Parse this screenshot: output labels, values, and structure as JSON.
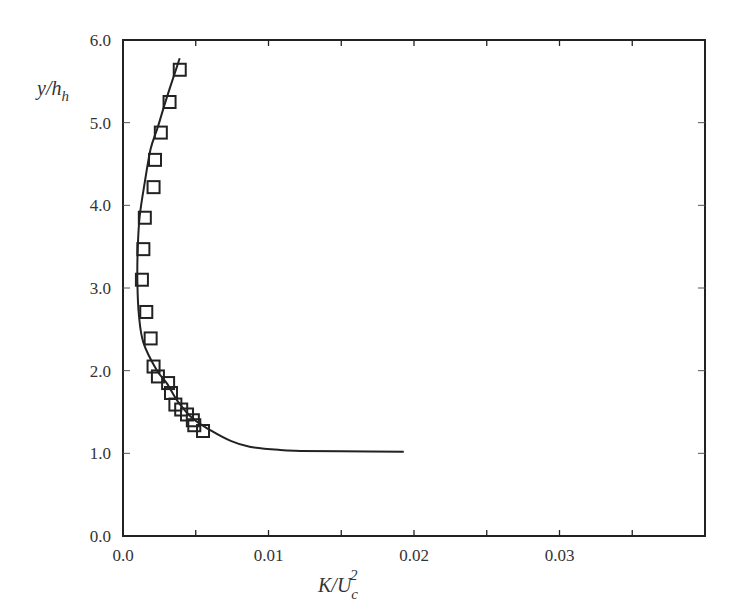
{
  "chart_data": {
    "type": "scatter",
    "title": "",
    "xlabel": "K/U_c^2",
    "xlabel_parts": {
      "main": "K/U",
      "sub": "c",
      "sup": "2"
    },
    "ylabel": "y/h_h",
    "ylabel_parts": {
      "main": "y/h",
      "sub": "h"
    },
    "xlim": [
      0.0,
      0.04
    ],
    "ylim": [
      0.0,
      6.0
    ],
    "x_ticks": [
      0.0,
      0.01,
      0.02,
      0.03
    ],
    "x_tick_labels": [
      "0.0",
      "0.01",
      "0.02",
      "0.03"
    ],
    "x_minor_ticks": [
      0.005,
      0.015,
      0.025,
      0.035
    ],
    "y_ticks": [
      0.0,
      1.0,
      2.0,
      3.0,
      4.0,
      5.0,
      6.0
    ],
    "y_tick_labels": [
      "0.0",
      "1.0",
      "2.0",
      "3.0",
      "4.0",
      "5.0",
      "6.0"
    ],
    "grid": false,
    "legend": null,
    "series": [
      {
        "name": "measurements",
        "kind": "markers",
        "marker": "open-square",
        "color": "#222222",
        "points": [
          [
            0.0039,
            5.64
          ],
          [
            0.0032,
            5.25
          ],
          [
            0.0026,
            4.88
          ],
          [
            0.0022,
            4.55
          ],
          [
            0.0021,
            4.22
          ],
          [
            0.0015,
            3.85
          ],
          [
            0.0014,
            3.47
          ],
          [
            0.0013,
            3.1
          ],
          [
            0.0016,
            2.71
          ],
          [
            0.0019,
            2.39
          ],
          [
            0.0021,
            2.05
          ],
          [
            0.0024,
            1.93
          ],
          [
            0.0031,
            1.85
          ],
          [
            0.0033,
            1.73
          ],
          [
            0.0036,
            1.59
          ],
          [
            0.004,
            1.53
          ],
          [
            0.0044,
            1.47
          ],
          [
            0.0048,
            1.4
          ],
          [
            0.0049,
            1.34
          ],
          [
            0.0055,
            1.27
          ]
        ]
      },
      {
        "name": "prediction",
        "kind": "line",
        "color": "#222222",
        "points": [
          [
            0.0039,
            5.78
          ],
          [
            0.003,
            5.3
          ],
          [
            0.0024,
            4.95
          ],
          [
            0.0019,
            4.68
          ],
          [
            0.0015,
            4.28
          ],
          [
            0.00115,
            3.87
          ],
          [
            0.00101,
            3.47
          ],
          [
            0.00099,
            3.06
          ],
          [
            0.0011,
            2.66
          ],
          [
            0.0014,
            2.34
          ],
          [
            0.0023,
            2.01
          ],
          [
            0.003,
            1.85
          ],
          [
            0.0038,
            1.62
          ],
          [
            0.0048,
            1.42
          ],
          [
            0.006,
            1.28
          ],
          [
            0.0074,
            1.15
          ],
          [
            0.0087,
            1.08
          ],
          [
            0.0108,
            1.04
          ],
          [
            0.0122,
            1.03
          ],
          [
            0.015,
            1.025
          ],
          [
            0.0193,
            1.02
          ]
        ]
      }
    ]
  }
}
